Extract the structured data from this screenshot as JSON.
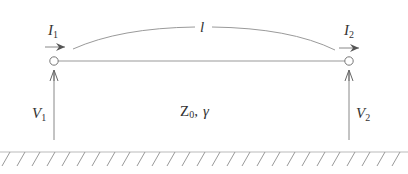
{
  "diagram": {
    "type": "transmission-line",
    "colors": {
      "stroke": "#8a8a8a",
      "text": "#333333",
      "background": "#ffffff"
    },
    "length_label": "l",
    "line_parameters": {
      "impedance": "Z",
      "impedance_sub": "0",
      "separator": ",",
      "propagation": "γ"
    },
    "port1": {
      "current": "I",
      "current_sub": "1",
      "voltage": "V",
      "voltage_sub": "1"
    },
    "port2": {
      "current": "I",
      "current_sub": "2",
      "voltage": "V",
      "voltage_sub": "2"
    },
    "ground": "ground-plane"
  }
}
